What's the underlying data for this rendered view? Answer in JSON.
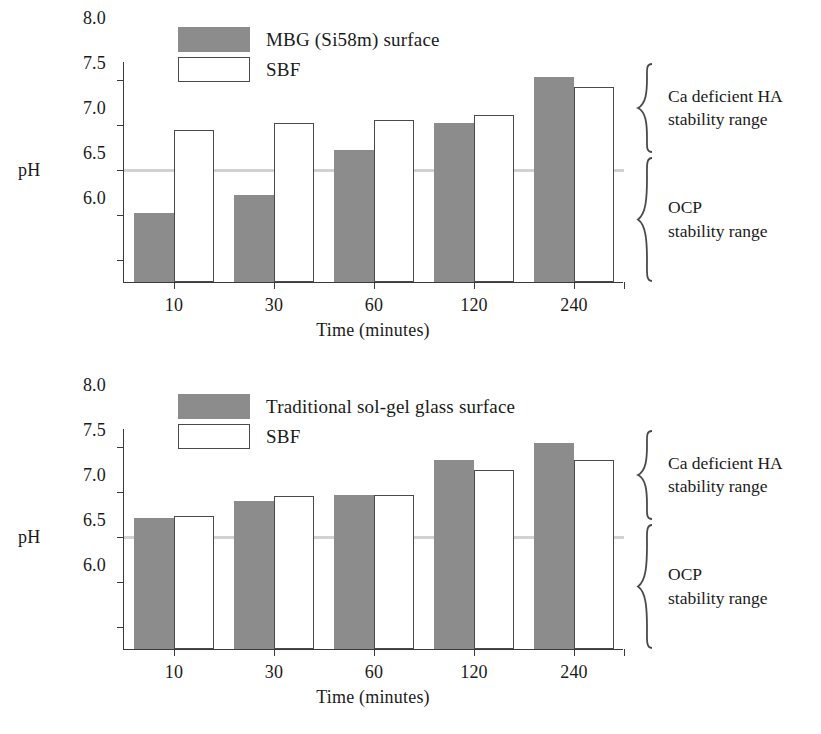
{
  "figure": {
    "axis_name": "pH",
    "x_axis_title": "Time (minutes)",
    "categories": [
      "10",
      "30",
      "60",
      "120",
      "240"
    ],
    "y_ticks": [
      "8.0",
      "7.5",
      "7.0",
      "6.5",
      "6.0"
    ],
    "neutral_ph": "7.0",
    "colors": {
      "bar_gray": "#8c8c8c",
      "bar_white_fill": "#ffffff",
      "bar_white_stroke": "#4a4a4a",
      "axis": "#3a3a3a",
      "neutral_line": "#d2d2d2",
      "text": "#1a1a1a"
    },
    "annotations": {
      "upper_line1": "Ca deficient HA",
      "upper_line2": "stability range",
      "lower_line1": "OCP",
      "lower_line2": "stability range"
    }
  },
  "chart_data": [
    {
      "type": "bar",
      "title": "MBG (Si58m) surface vs SBF pH evolution",
      "panel": "top",
      "xlabel": "Time (minutes)",
      "ylabel": "pH",
      "categories": [
        "10",
        "30",
        "60",
        "120",
        "240"
      ],
      "ylim": [
        5.75,
        8.2
      ],
      "yticks": [
        6.0,
        6.5,
        7.0,
        7.5,
        8.0
      ],
      "grid": false,
      "legend_position": "top-left",
      "reference_lines": [
        {
          "y": 7.0,
          "label": "neutral pH",
          "color": "#d2d2d2"
        }
      ],
      "series": [
        {
          "name": "MBG (Si58m) surface",
          "style": "filled-gray",
          "values": [
            6.51,
            6.71,
            7.21,
            7.51,
            8.02
          ]
        },
        {
          "name": "SBF",
          "style": "open-white",
          "values": [
            7.43,
            7.51,
            7.55,
            7.6,
            7.91
          ]
        }
      ],
      "annotations": [
        {
          "text": "Ca deficient HA stability range",
          "range": [
            7.0,
            8.2
          ],
          "marker": "brace"
        },
        {
          "text": "OCP stability range",
          "range": [
            5.75,
            7.0
          ],
          "marker": "brace"
        }
      ]
    },
    {
      "type": "bar",
      "title": "Traditional sol-gel glass surface vs SBF pH evolution",
      "panel": "bottom",
      "xlabel": "Time (minutes)",
      "ylabel": "pH",
      "categories": [
        "10",
        "30",
        "60",
        "120",
        "240"
      ],
      "ylim": [
        5.75,
        8.2
      ],
      "yticks": [
        6.0,
        6.5,
        7.0,
        7.5,
        8.0
      ],
      "grid": false,
      "legend_position": "top-left",
      "reference_lines": [
        {
          "y": 7.0,
          "label": "neutral pH",
          "color": "#d2d2d2"
        }
      ],
      "series": [
        {
          "name": "Traditional sol-gel glass surface",
          "style": "filled-gray",
          "values": [
            7.2,
            7.39,
            7.46,
            7.85,
            8.03
          ]
        },
        {
          "name": "SBF",
          "style": "open-white",
          "values": [
            7.22,
            7.45,
            7.46,
            7.74,
            7.84
          ]
        }
      ],
      "annotations": [
        {
          "text": "Ca deficient HA stability range",
          "range": [
            7.0,
            8.2
          ],
          "marker": "brace"
        },
        {
          "text": "OCP stability range",
          "range": [
            5.75,
            7.0
          ],
          "marker": "brace"
        }
      ]
    }
  ],
  "panels": {
    "top": {
      "legend": [
        {
          "label": "MBG (Si58m) surface",
          "style": "gray"
        },
        {
          "label": "SBF",
          "style": "white"
        }
      ]
    },
    "bottom": {
      "legend": [
        {
          "label": "Traditional sol-gel glass surface",
          "style": "gray"
        },
        {
          "label": "SBF",
          "style": "white"
        }
      ]
    }
  }
}
